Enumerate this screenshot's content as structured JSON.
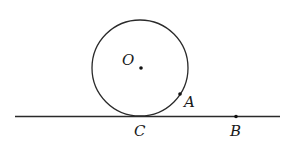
{
  "diagram": {
    "stroke_color": "#2a2a2a",
    "circle": {
      "cx": 140,
      "cy": 68,
      "r": 48
    },
    "line": {
      "x1": 15,
      "y1": 116.5,
      "x2": 280,
      "y2": 116.5
    },
    "points": {
      "O": {
        "label": "O",
        "x": 141,
        "y": 68
      },
      "A": {
        "label": "A",
        "x": 180,
        "y": 94
      },
      "B": {
        "label": "B",
        "x": 236,
        "y": 116.5
      },
      "C": {
        "label": "C",
        "x": 140,
        "y": 116.5
      }
    },
    "labels": {
      "O": "O",
      "A": "A",
      "B": "B",
      "C": "C"
    }
  }
}
